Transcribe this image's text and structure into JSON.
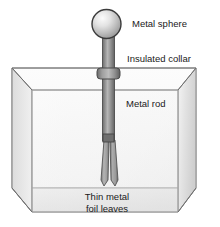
{
  "diagram": {
    "labels": {
      "sphere": "Metal sphere",
      "collar": "Insulated collar",
      "rod": "Metal rod",
      "leaves_line1": "Thin metal",
      "leaves_line2": "foil leaves"
    },
    "parts": {
      "sphere_name": "metal-sphere",
      "collar_name": "insulated-collar",
      "rod_name": "metal-rod",
      "leaf_left_name": "foil-leaf-left",
      "leaf_right_name": "foil-leaf-right",
      "box_name": "glass-container"
    },
    "colors": {
      "outline": "#3b3b3b",
      "box_line": "#8a8a8a",
      "metal_light": "#e6e6e6",
      "metal_mid": "#9a9a9a",
      "metal_dark": "#5a5a5a",
      "glass_light": "#fdfdfd",
      "glass_shade": "#d8d8d8",
      "text": "#1a1a1a",
      "background": "#ffffff"
    }
  }
}
